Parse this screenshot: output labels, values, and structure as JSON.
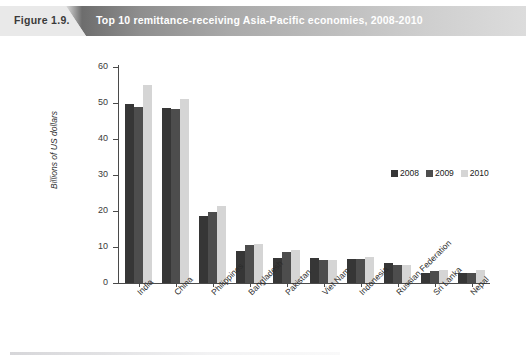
{
  "header": {
    "figure_number": "Figure 1.9.",
    "title": "Top 10 remittance-receiving Asia-Pacific economies, 2008-2010"
  },
  "legend": {
    "items": [
      {
        "label": "2008",
        "color": "#363636"
      },
      {
        "label": "2009",
        "color": "#4d4d4d"
      },
      {
        "label": "2010",
        "color": "#d5d5d5"
      }
    ]
  },
  "axis": {
    "y_title": "Billions of US dollars",
    "y_ticks": [
      "0",
      "10",
      "20",
      "30",
      "40",
      "50",
      "60"
    ]
  },
  "chart_data": {
    "type": "bar",
    "title": "Top 10 remittance-receiving Asia-Pacific economies, 2008-2010",
    "xlabel": "",
    "ylabel": "Billions of US dollars",
    "ylim": [
      0,
      60
    ],
    "ytick_step": 10,
    "grid": false,
    "legend_position": "inside-right",
    "categories": [
      "India",
      "China",
      "Philippines",
      "Bangladesh",
      "Pakistan",
      "Viet Nam",
      "Indonesia",
      "Russian Federation",
      "Sri Lanka",
      "Nepal"
    ],
    "series": [
      {
        "name": "2008",
        "color": "#363636",
        "values": [
          49.6,
          48.5,
          18.6,
          9.0,
          7.0,
          7.0,
          6.8,
          5.5,
          2.9,
          2.7
        ]
      },
      {
        "name": "2009",
        "color": "#4d4d4d",
        "values": [
          49.0,
          48.4,
          19.8,
          10.5,
          8.7,
          6.4,
          6.8,
          5.1,
          3.3,
          2.9
        ]
      },
      {
        "name": "2010",
        "color": "#d5d5d5",
        "values": [
          55.0,
          51.0,
          21.3,
          10.8,
          9.1,
          6.4,
          7.1,
          5.1,
          3.6,
          3.5
        ]
      }
    ]
  }
}
